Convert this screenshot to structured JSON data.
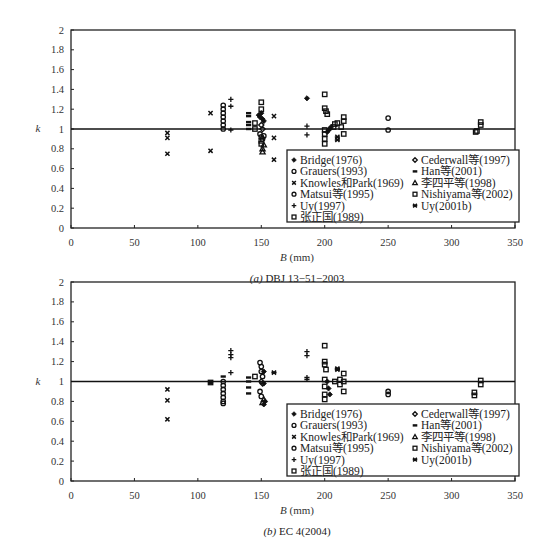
{
  "chart_data": [
    {
      "type": "scatter",
      "caption": "(a) DBJ 13-51-2003",
      "caption_prefix": "(a)",
      "caption_text": "DBJ 13−51−2003",
      "xlabel": "B (mm)",
      "ylabel": "k",
      "xlim": [
        0,
        350
      ],
      "ylim": [
        0,
        2
      ],
      "xticks": [
        "0",
        "50",
        "100",
        "150",
        "200",
        "250",
        "300",
        "350"
      ],
      "yticks": [
        "0",
        "0.2",
        "0.4",
        "0.6",
        "0.8",
        "1",
        "1.2",
        "1.4",
        "1.6",
        "1.8",
        "2"
      ],
      "reference_line_y": 1,
      "grid": false,
      "legend_position": "bottom-right",
      "series": [
        {
          "name": "Bridge(1976)",
          "marker": "diamond-filled",
          "points": [
            [
              186,
              1.31
            ],
            [
              202,
              0.97
            ],
            [
              203,
              0.99
            ],
            [
              204,
              1.0
            ],
            [
              205,
              1.02
            ],
            [
              148,
              1.14
            ],
            [
              149,
              1.12
            ],
            [
              150,
              1.16
            ],
            [
              151,
              1.1
            ],
            [
              152,
              1.08
            ]
          ]
        },
        {
          "name": "Cederwall等(1997)",
          "marker": "diamond-open",
          "points": [
            [
              150,
              1.04
            ],
            [
              151,
              1.0
            ]
          ]
        },
        {
          "name": "Grauers(1993)",
          "marker": "circle-open",
          "points": [
            [
              120,
              1.24
            ],
            [
              120,
              1.2
            ],
            [
              120,
              1.16
            ],
            [
              120,
              1.12
            ],
            [
              120,
              1.08
            ],
            [
              120,
              1.04
            ],
            [
              120,
              1.0
            ],
            [
              250,
              0.99
            ],
            [
              250,
              1.11
            ]
          ]
        },
        {
          "name": "Han等(2001)",
          "marker": "dash",
          "points": [
            [
              140,
              1.16
            ],
            [
              140,
              1.13
            ],
            [
              140,
              1.07
            ],
            [
              140,
              1.04
            ],
            [
              140,
              1.0
            ]
          ]
        },
        {
          "name": "Knowles和Park(1969)",
          "marker": "x",
          "points": [
            [
              76,
              0.96
            ],
            [
              76,
              0.91
            ],
            [
              76,
              0.75
            ],
            [
              110,
              1.16
            ],
            [
              110,
              0.78
            ],
            [
              160,
              1.13
            ],
            [
              160,
              0.91
            ],
            [
              160,
              0.69
            ]
          ]
        },
        {
          "name": "李四平等(1998)",
          "marker": "triangle-open",
          "points": [
            [
              151,
              0.77
            ],
            [
              151,
              0.8
            ],
            [
              152,
              0.84
            ]
          ]
        },
        {
          "name": "Matsui等(1995)",
          "marker": "circle-open",
          "points": [
            [
              149,
              0.95
            ],
            [
              150,
              0.92
            ],
            [
              151,
              0.9
            ],
            [
              152,
              0.93
            ]
          ]
        },
        {
          "name": "Nishiyama等(2002)",
          "marker": "square-open",
          "points": [
            [
              200,
              1.21
            ],
            [
              201,
              1.18
            ],
            [
              202,
              1.15
            ],
            [
              215,
              1.12
            ],
            [
              215,
              1.08
            ],
            [
              215,
              0.95
            ],
            [
              213,
              1.02
            ],
            [
              319,
              0.97
            ],
            [
              320,
              0.98
            ],
            [
              323,
              1.04
            ],
            [
              323,
              1.07
            ]
          ]
        },
        {
          "name": "Uy(1997)",
          "marker": "plus",
          "points": [
            [
              126,
              1.3
            ],
            [
              126,
              1.23
            ],
            [
              126,
              0.99
            ],
            [
              186,
              1.03
            ],
            [
              186,
              0.94
            ]
          ]
        },
        {
          "name": "Uy(2001b)",
          "marker": "star",
          "points": [
            [
              210,
              0.92
            ],
            [
              210,
              0.89
            ]
          ]
        },
        {
          "name": "张正国(1989)",
          "marker": "square-open",
          "points": [
            [
              145,
              1.06
            ],
            [
              145,
              1.0
            ],
            [
              150,
              1.27
            ],
            [
              150,
              1.2
            ],
            [
              150,
              0.88
            ],
            [
              150,
              0.85
            ],
            [
              200,
              1.35
            ],
            [
              200,
              0.99
            ],
            [
              200,
              0.95
            ],
            [
              200,
              0.9
            ],
            [
              200,
              0.85
            ],
            [
              207,
              1.02
            ],
            [
              208,
              1.05
            ],
            [
              210,
              1.06
            ]
          ]
        }
      ]
    },
    {
      "type": "scatter",
      "caption": "(b) EC 4(2004)",
      "caption_prefix": "(b)",
      "caption_text": "EC 4(2004)",
      "xlabel": "B (mm)",
      "ylabel": "k",
      "xlim": [
        0,
        350
      ],
      "ylim": [
        0,
        2
      ],
      "xticks": [
        "0",
        "50",
        "100",
        "150",
        "200",
        "250",
        "300",
        "350"
      ],
      "yticks": [
        "0",
        "0.2",
        "0.4",
        "0.6",
        "0.8",
        "1",
        "1.2",
        "1.4",
        "1.6",
        "1.8",
        "2"
      ],
      "reference_line_y": 1,
      "grid": false,
      "legend_position": "bottom-right",
      "series": [
        {
          "name": "Bridge(1976)",
          "marker": "diamond-filled",
          "points": [
            [
              202,
              1.0
            ],
            [
              203,
              0.93
            ],
            [
              204,
              0.87
            ],
            [
              152,
              0.77
            ],
            [
              153,
              0.8
            ],
            [
              152,
              0.98
            ],
            [
              152,
              1.1
            ]
          ]
        },
        {
          "name": "Cederwall等(1997)",
          "marker": "diamond-open",
          "points": [
            [
              150,
              1.0
            ],
            [
              151,
              0.98
            ]
          ]
        },
        {
          "name": "Grauers(1993)",
          "marker": "circle-open",
          "points": [
            [
              120,
              1.0
            ],
            [
              120,
              0.96
            ],
            [
              120,
              0.92
            ],
            [
              120,
              0.88
            ],
            [
              120,
              0.84
            ],
            [
              120,
              0.8
            ],
            [
              120,
              0.78
            ],
            [
              250,
              0.87
            ],
            [
              250,
              0.9
            ]
          ]
        },
        {
          "name": "Han等(2001)",
          "marker": "dash",
          "points": [
            [
              120,
              1.05
            ],
            [
              140,
              1.04
            ],
            [
              140,
              1.0
            ],
            [
              140,
              0.94
            ],
            [
              140,
              0.88
            ]
          ]
        },
        {
          "name": "Knowles和Park(1969)",
          "marker": "x",
          "points": [
            [
              76,
              0.92
            ],
            [
              76,
              0.81
            ],
            [
              76,
              0.62
            ]
          ]
        },
        {
          "name": "李四平等(1998)",
          "marker": "triangle-open",
          "points": [
            [
              151,
              0.79
            ],
            [
              152,
              0.82
            ]
          ]
        },
        {
          "name": "Matsui等(1995)",
          "marker": "circle-open",
          "points": [
            [
              149,
              1.19
            ],
            [
              150,
              1.15
            ],
            [
              150,
              1.1
            ],
            [
              151,
              1.05
            ],
            [
              149,
              0.9
            ],
            [
              150,
              0.85
            ]
          ]
        },
        {
          "name": "Nishiyama等(2002)",
          "marker": "square-open",
          "points": [
            [
              200,
              1.2
            ],
            [
              200,
              1.17
            ],
            [
              201,
              1.12
            ],
            [
              215,
              1.08
            ],
            [
              215,
              1.0
            ],
            [
              215,
              0.9
            ],
            [
              212,
              0.97
            ],
            [
              318,
              0.86
            ],
            [
              318,
              0.89
            ],
            [
              323,
              0.97
            ],
            [
              323,
              1.01
            ]
          ]
        },
        {
          "name": "Uy(1997)",
          "marker": "plus",
          "points": [
            [
              126,
              1.31
            ],
            [
              126,
              1.27
            ],
            [
              126,
              1.24
            ],
            [
              126,
              1.09
            ],
            [
              186,
              1.3
            ],
            [
              186,
              1.26
            ],
            [
              186,
              1.04
            ],
            [
              186,
              1.02
            ]
          ]
        },
        {
          "name": "Uy(2001b)",
          "marker": "star",
          "points": [
            [
              110,
              0.99
            ],
            [
              160,
              1.09
            ],
            [
              210,
              1.13
            ],
            [
              210,
              1.12
            ]
          ]
        },
        {
          "name": "张正国(1989)",
          "marker": "square-open",
          "points": [
            [
              110,
              0.99
            ],
            [
              145,
              1.05
            ],
            [
              200,
              1.36
            ],
            [
              200,
              1.02
            ],
            [
              200,
              0.95
            ],
            [
              200,
              0.87
            ],
            [
              200,
              0.82
            ],
            [
              210,
              0.63
            ],
            [
              208,
              1.0
            ],
            [
              212,
              1.02
            ]
          ]
        }
      ]
    }
  ],
  "legend_columns": [
    [
      "Bridge(1976)",
      "Grauers(1993)",
      "Knowles和Park(1969)",
      "Matsui等(1995)",
      "Uy(1997)",
      "张正国(1989)"
    ],
    [
      "Cederwall等(1997)",
      "Han等(2001)",
      "李四平等(1998)",
      "Nishiyama等(2002)",
      "Uy(2001b)"
    ]
  ]
}
